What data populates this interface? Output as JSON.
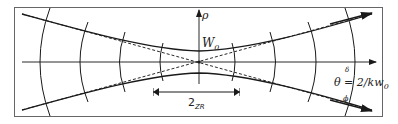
{
  "diagram": {
    "labels": {
      "rho": "ρ",
      "waist": "W",
      "waist_sub": "0",
      "rayleigh_main": "2",
      "rayleigh_sub": "ZR",
      "angle": "θ = 2/kw",
      "angle_sub": "0",
      "angle_marker_top": "δ",
      "angle_marker_bottom": "ϕ"
    },
    "colors": {
      "line": "#2a2a2a",
      "frame": "#555555",
      "background": "#ffffff"
    }
  }
}
